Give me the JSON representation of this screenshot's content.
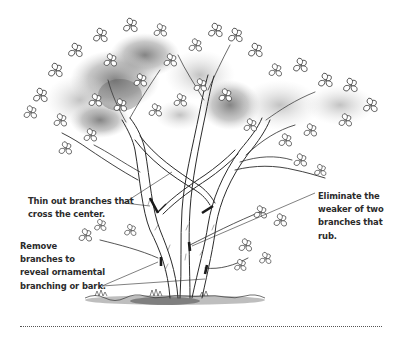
{
  "illustration": {
    "subject": "multi-stemmed ornamental tree with pruning cut marks",
    "colors": {
      "ink": "#2b2b2b",
      "foliage_wash": "#9a9a9a",
      "foliage_dark": "#5e5e5e",
      "cut_mark": "#1a1a1a",
      "background": "#ffffff"
    },
    "cut_marks": 6
  },
  "callouts": {
    "thin_out": {
      "lines": [
        "Thin out branches that",
        "cross the center."
      ]
    },
    "remove": {
      "lines": [
        "Remove",
        "branches to",
        "reveal ornamental",
        "branching or bark."
      ]
    },
    "eliminate": {
      "lines": [
        "Eliminate the",
        "weaker of two",
        "branches that",
        "rub."
      ]
    }
  },
  "divider": {
    "style": "dotted"
  }
}
